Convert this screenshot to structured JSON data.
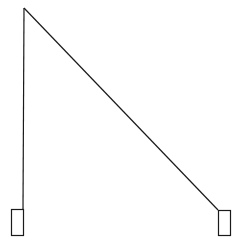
{
  "diagram": {
    "background": "#ffffff",
    "stroke": "#1a1a1a",
    "apex": {
      "x": 24,
      "y": 8
    },
    "left_line_end": {
      "x": 23,
      "y": 209
    },
    "right_line_end": {
      "x": 218,
      "y": 210
    },
    "left_box": {
      "x": 11.5,
      "y": 209.5,
      "w": 12,
      "h": 26
    },
    "right_box": {
      "x": 218.5,
      "y": 210.5,
      "w": 12,
      "h": 25
    }
  }
}
